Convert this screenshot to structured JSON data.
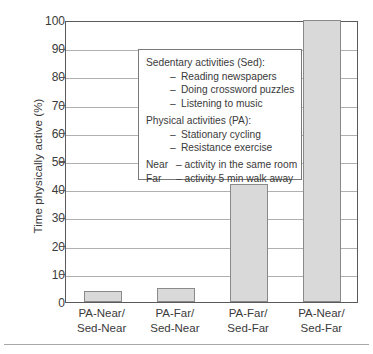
{
  "chart_data": {
    "type": "bar",
    "title": "",
    "xlabel": "",
    "ylabel": "Time physically active (%)",
    "ylim": [
      0,
      100
    ],
    "ytick_values": [
      0,
      10,
      20,
      30,
      40,
      50,
      60,
      70,
      80,
      90,
      100
    ],
    "ytick_labels": [
      "0",
      "10",
      "20",
      "30",
      "40",
      "50",
      "60",
      "70",
      "80",
      "90",
      "100"
    ],
    "grid": true,
    "grid_axis": "y",
    "legend_position": "inside-upper-left",
    "categories": [
      "PA-Near/\nSed-Near",
      "PA-Far/\nSed-Near",
      "PA-Far/\nSed-Far",
      "PA-Near/\nSed-Far"
    ],
    "values": [
      4,
      5,
      41.7,
      100
    ],
    "bar_color": "#d9d9d9",
    "bar_edge_color": "#8a8a8a"
  },
  "axis": {
    "y_title": "Time physically active (%)",
    "y_ticks": [
      {
        "label": "100",
        "value": 100
      },
      {
        "label": "90",
        "value": 90
      },
      {
        "label": "80",
        "value": 80
      },
      {
        "label": "70",
        "value": 70
      },
      {
        "label": "60",
        "value": 60
      },
      {
        "label": "50",
        "value": 50
      },
      {
        "label": "40",
        "value": 40
      },
      {
        "label": "30",
        "value": 30
      },
      {
        "label": "20",
        "value": 20
      },
      {
        "label": "10",
        "value": 10
      },
      {
        "label": "0",
        "value": 0
      }
    ],
    "x_categories": [
      {
        "line1": "PA-Near/",
        "line2": "Sed-Near"
      },
      {
        "line1": "PA-Far/",
        "line2": "Sed-Near"
      },
      {
        "line1": "PA-Far/",
        "line2": "Sed-Far"
      },
      {
        "line1": "PA-Near/",
        "line2": "Sed-Far"
      }
    ]
  },
  "legend": {
    "sedentary_heading": "Sedentary activities (Sed):",
    "sedentary_items": [
      "Reading newspapers",
      "Doing crossword puzzles",
      "Listening to music"
    ],
    "physical_heading": "Physical activities (PA):",
    "physical_items": [
      "Stationary cycling",
      "Resistance exercise"
    ],
    "definitions": [
      {
        "term": "Near",
        "text": "– activity in the same room"
      },
      {
        "term": "Far",
        "text": "– activity 5 min walk away"
      }
    ],
    "dash": "–"
  },
  "colors": {
    "bar_fill": "#d9d9d9",
    "bar_edge": "#8a8a8a",
    "axis": "#5a5a5a",
    "gridline": "#b0b0b0",
    "text": "#3a3a3a"
  }
}
